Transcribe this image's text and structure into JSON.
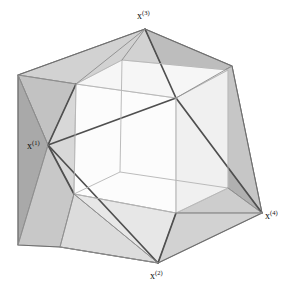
{
  "figure": {
    "background_color": "#ffffff",
    "width": 292,
    "height": 294,
    "labels": [
      {
        "id": "x1",
        "base": "x",
        "superscript": "(1)",
        "text": "x(1)",
        "x": 27,
        "y": 149
      },
      {
        "id": "x2",
        "base": "x",
        "superscript": "(2)",
        "text": "x(2)",
        "x": 150,
        "y": 279
      },
      {
        "id": "x3",
        "base": "x",
        "superscript": "(3)",
        "text": "x(3)",
        "x": 137,
        "y": 19
      },
      {
        "id": "x4",
        "base": "x",
        "superscript": "(4)",
        "text": "x(4)",
        "x": 265,
        "y": 219
      }
    ],
    "colors": {
      "edge_dark": "#4a4a4a",
      "edge_light": "#b6b6b6",
      "face_dark": "#a9a9a9",
      "face_mid": "#c4c4c4",
      "face_light": "#d6d6d6",
      "face_pale": "#e4e4e4",
      "face_white": "#fbfbfb",
      "label_color": "#111111"
    },
    "vertices": {
      "apex_x1": [
        48,
        145
      ],
      "apex_x2": [
        158,
        263
      ],
      "apex_x3": [
        145,
        29
      ],
      "apex_x4": [
        262,
        213
      ],
      "cube_front_top_left": [
        76,
        84
      ],
      "cube_front_top_right": [
        176,
        98
      ],
      "cube_front_bottom_left": [
        74,
        194
      ],
      "cube_front_bottom_right": [
        176,
        213
      ],
      "cube_back_top_left": [
        122,
        60
      ],
      "cube_back_top_right": [
        228,
        70
      ],
      "cube_back_bottom_left": [
        120,
        172
      ],
      "cube_back_bottom_right": [
        228,
        188
      ],
      "silhouette_left_top": [
        18,
        75
      ],
      "silhouette_left_bottom": [
        18,
        245
      ],
      "silhouette_top_right": [
        232,
        66
      ],
      "silhouette_bottom_mid": [
        60,
        247
      ]
    },
    "structure": {
      "inner_solid": "cube",
      "spike_count": 4,
      "spike_shape": "tetrahedral pyramid"
    }
  }
}
